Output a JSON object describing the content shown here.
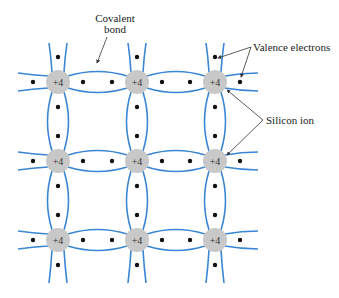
{
  "diagram": {
    "ion_charge": "+4",
    "grid": {
      "columns_x": [
        58,
        137,
        215
      ],
      "rows_y": [
        82,
        161,
        240
      ],
      "ion_radius": 12
    },
    "colors": {
      "bond": "#3a86d4",
      "ion_fill": "#c8c8c8",
      "electron": "#111111",
      "arrow": "#333333",
      "text": "#222222"
    },
    "labels": {
      "covalent_bond_line1": "Covalent",
      "covalent_bond_line2": "bond",
      "valence_electrons": "Valence electrons",
      "silicon_ion": "Silicon ion"
    },
    "ions": [
      {
        "row": 0,
        "col": 0,
        "label": "+4"
      },
      {
        "row": 0,
        "col": 1,
        "label": "+4"
      },
      {
        "row": 0,
        "col": 2,
        "label": "+4"
      },
      {
        "row": 1,
        "col": 0,
        "label": "+4"
      },
      {
        "row": 1,
        "col": 1,
        "label": "+4"
      },
      {
        "row": 1,
        "col": 2,
        "label": "+4"
      },
      {
        "row": 2,
        "col": 0,
        "label": "+4"
      },
      {
        "row": 2,
        "col": 1,
        "label": "+4"
      },
      {
        "row": 2,
        "col": 2,
        "label": "+4"
      }
    ]
  }
}
